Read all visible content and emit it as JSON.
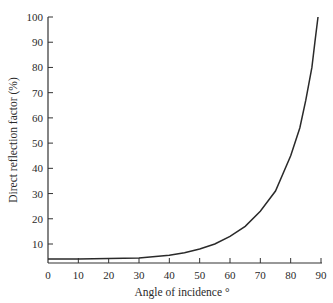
{
  "chart_data": {
    "type": "line",
    "title": "",
    "xlabel": "Angle of incidence °",
    "ylabel": "Direct reflection factor (%)",
    "xlim": [
      0,
      90
    ],
    "ylim": [
      0,
      100
    ],
    "x_ticks": [
      0,
      10,
      20,
      30,
      40,
      50,
      60,
      70,
      80,
      90
    ],
    "y_ticks": [
      10,
      20,
      30,
      40,
      50,
      60,
      70,
      80,
      90,
      100
    ],
    "grid": false,
    "legend": null,
    "series": [
      {
        "name": "Direct reflection factor",
        "x": [
          0,
          10,
          20,
          30,
          40,
          45,
          50,
          55,
          60,
          65,
          70,
          75,
          80,
          83,
          85,
          87,
          88,
          89
        ],
        "y": [
          4,
          4,
          4.2,
          4.5,
          5.5,
          6.5,
          8,
          10,
          13,
          17,
          23,
          31,
          45,
          56,
          67,
          80,
          90,
          100
        ]
      }
    ]
  }
}
